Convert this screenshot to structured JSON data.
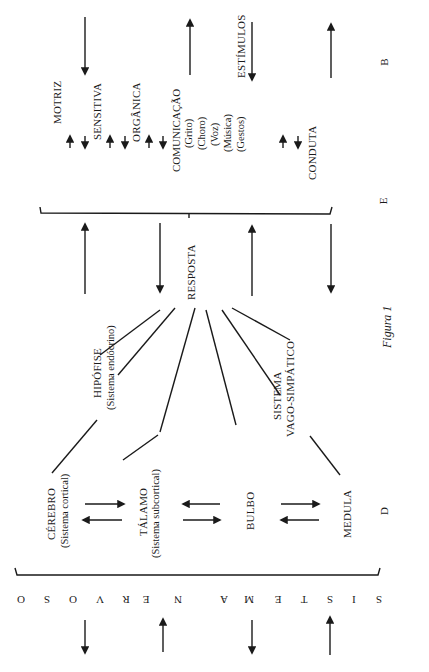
{
  "figure": {
    "caption": "Figura 1",
    "side_labels": {
      "top": "B",
      "middle": "E",
      "bottom": "D"
    },
    "stimulus_label": "ESTÍMULOS",
    "response_label": "RESPOSTA",
    "response_types": {
      "motriz": "MOTRIZ",
      "sensitiva": "SENSITIVA",
      "organica": "ORGÂNICA",
      "comunicacao": "COMUNICAÇÃO",
      "comunicacao_items": [
        "(Grito)",
        "(Choro)",
        "(Voz)",
        "(Música)",
        "(Gestos)"
      ],
      "conduta": "CONDUTA"
    },
    "nervous_system": {
      "hipofise": "HIPÓFISE",
      "hipofise_sub": "(Sistema endócrino)",
      "cerebro": "CÉREBRO",
      "cerebro_sub": "(Sistema cortical)",
      "talamo": "TÁLAMO",
      "talamo_sub": "(Sistema subcortical)",
      "bulbo": "BULBO",
      "sistema_vago": "SISTEMA",
      "sistema_vago_2": "VAGO-SIMPÁTICO",
      "medula": "MEDULA"
    },
    "bottom_title_letters": [
      "O",
      "S",
      "O",
      "V",
      "R",
      "E",
      "N",
      "",
      "A",
      "M",
      "E",
      "T",
      "S",
      "I",
      "S"
    ],
    "bottom_title": "SISTEMA NERVOSO"
  }
}
